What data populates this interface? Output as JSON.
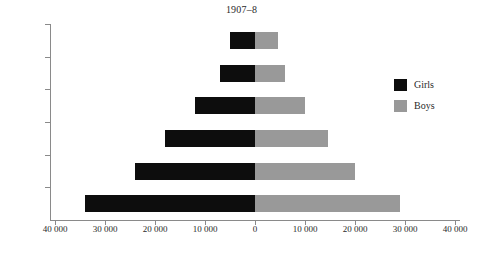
{
  "chart_data": {
    "type": "bar",
    "orientation": "horizontal",
    "layout": "population-pyramid",
    "title": "1907–8",
    "xlabel": "",
    "ylabel": "Years",
    "categories": [
      "1th",
      "2th",
      "3th",
      "4th",
      "5th",
      "6th"
    ],
    "series": [
      {
        "name": "Girls",
        "color": "#0d0d0d",
        "direction": "left",
        "values": [
          34000,
          24000,
          18000,
          12000,
          7000,
          5000
        ]
      },
      {
        "name": "Boys",
        "color": "#999999",
        "direction": "right",
        "values": [
          29000,
          20000,
          14500,
          10000,
          6000,
          4500
        ]
      }
    ],
    "xlim": [
      -40000,
      40000
    ],
    "xticks": [
      -40000,
      -30000,
      -20000,
      -10000,
      0,
      10000,
      20000,
      30000,
      40000
    ],
    "xtick_labels": [
      "40 000",
      "30 000",
      "20 000",
      "10 000",
      "0",
      "10 000",
      "20 000",
      "30 000",
      "40 000"
    ],
    "grid": false,
    "legend_position": "right"
  },
  "legend": {
    "items": [
      {
        "label": "Girls",
        "color": "#0d0d0d"
      },
      {
        "label": "Boys",
        "color": "#999999"
      }
    ]
  }
}
